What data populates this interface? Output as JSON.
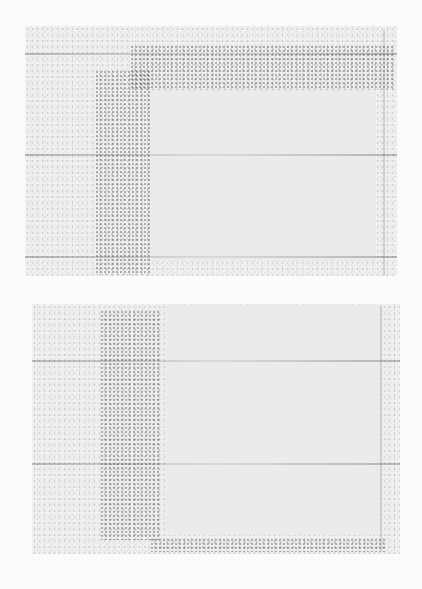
{
  "page": {
    "width": 422,
    "height": 589,
    "background": "#fbfbfa"
  },
  "panels": [
    {
      "name": "top-panel",
      "x": 25,
      "y": 26,
      "w": 372,
      "h": 250,
      "fill": "#f0f0ef",
      "inner_box": {
        "x": 150,
        "y": 85,
        "w": 225,
        "h": 175,
        "fill": "#ebebea"
      },
      "dark_band_vertical": {
        "x": 95,
        "y": 70,
        "w": 55,
        "h": 205
      },
      "dark_band_horizontal": {
        "x": 130,
        "y": 45,
        "w": 265,
        "h": 45
      },
      "grid_lines_y": [
        53,
        154,
        256
      ]
    },
    {
      "name": "bottom-panel",
      "x": 32,
      "y": 304,
      "w": 368,
      "h": 250,
      "fill": "#f0f0ef",
      "inner_box": {
        "x": 165,
        "y": 305,
        "w": 215,
        "h": 230,
        "fill": "#ebebea"
      },
      "dark_band_vertical": {
        "x": 100,
        "y": 310,
        "w": 60,
        "h": 230
      },
      "dark_band_horizontal": {
        "x": 150,
        "y": 538,
        "w": 235,
        "h": 14
      },
      "grid_lines_y": [
        360,
        463
      ]
    }
  ]
}
